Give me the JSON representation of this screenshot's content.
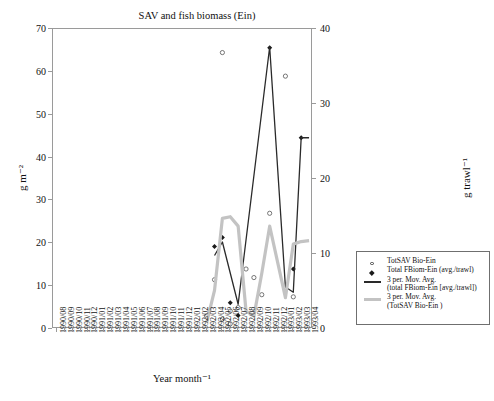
{
  "chart_data": {
    "type": "line",
    "title": "SAV and fish biomass (Ein)",
    "xlabel": "Year month⁻¹",
    "ylabel_left": "g m⁻²",
    "ylabel_right": "g trawl⁻¹",
    "ylim_left": [
      0,
      70
    ],
    "ylim_right": [
      0,
      40
    ],
    "ytick_left": [
      0,
      10,
      20,
      30,
      40,
      50,
      60,
      70
    ],
    "ytick_right": [
      0,
      10,
      20,
      30,
      40
    ],
    "grid": false,
    "legend_position": "right-outside",
    "categories": [
      "1990/08",
      "1990/09",
      "1990/10",
      "1990/11",
      "1990/12",
      "1991/01",
      "1991/02",
      "1991/03",
      "1991/04",
      "1991/05",
      "1991/06",
      "1991/07",
      "1991/08",
      "1991/09",
      "1991/10",
      "1991/11",
      "1991/12",
      "1992/01",
      "1992/02",
      "1992/03",
      "1992/04",
      "1992/05",
      "1992/06",
      "1992/07",
      "1992/08",
      "1992/09",
      "1992/10",
      "1992/11",
      "1992/12",
      "1993/01",
      "1993/02",
      "1993/03",
      "1993/04"
    ],
    "series": [
      {
        "name": "TotSAV Bio-Ein",
        "marker": "open-circle",
        "axis": "left",
        "points": [
          {
            "x": "1992/03",
            "y": 3.0
          },
          {
            "x": "1992/04",
            "y": 11.5
          },
          {
            "x": "1992/05",
            "y": 64.5
          },
          {
            "x": "1992/05",
            "y": 2.3
          },
          {
            "x": "1992/06",
            "y": 1.2
          },
          {
            "x": "1992/06",
            "y": 4.2
          },
          {
            "x": "1992/07",
            "y": 5.0
          },
          {
            "x": "1992/08",
            "y": 14.0
          },
          {
            "x": "1992/09",
            "y": 12.0
          },
          {
            "x": "1992/10",
            "y": 8.0
          },
          {
            "x": "1992/11",
            "y": 27.0
          },
          {
            "x": "1993/01",
            "y": 59.0
          },
          {
            "x": "1993/02",
            "y": 7.5
          }
        ]
      },
      {
        "name": "Total FBiom-Ein (avg./trawl)",
        "marker": "filled-diamond",
        "axis": "right",
        "points": [
          {
            "x": "1992/04",
            "y": 11.0
          },
          {
            "x": "1992/05",
            "y": 12.2
          },
          {
            "x": "1992/06",
            "y": 3.5
          },
          {
            "x": "1992/07",
            "y": 1.8
          },
          {
            "x": "1992/11",
            "y": 37.5
          },
          {
            "x": "1993/02",
            "y": 8.0
          },
          {
            "x": "1993/03",
            "y": 25.5
          }
        ]
      },
      {
        "name": "3 per. Mov. Avg.\n(total FBiom-Ein [avg./trawl])",
        "marker": "line-dark",
        "axis": "right",
        "points": [
          {
            "x": "1992/04",
            "y": 9.8
          },
          {
            "x": "1992/05",
            "y": 11.6
          },
          {
            "x": "1992/07",
            "y": 3.3
          },
          {
            "x": "1992/11",
            "y": 37.6
          },
          {
            "x": "1993/01",
            "y": 5.6
          },
          {
            "x": "1993/02",
            "y": 4.9
          },
          {
            "x": "1993/03",
            "y": 25.5
          },
          {
            "x": "1993/04",
            "y": 25.5
          }
        ]
      },
      {
        "name": "3 per. Mov. Avg.\n(TotSAV Bio-Ein )",
        "marker": "line-gray",
        "axis": "left",
        "points": [
          {
            "x": "1992/03",
            "y": 1.5
          },
          {
            "x": "1992/04",
            "y": 9.0
          },
          {
            "x": "1992/05",
            "y": 25.8
          },
          {
            "x": "1992/06",
            "y": 26.2
          },
          {
            "x": "1992/07",
            "y": 24.0
          },
          {
            "x": "1992/08",
            "y": 4.2
          },
          {
            "x": "1992/09",
            "y": 3.0
          },
          {
            "x": "1992/10",
            "y": 13.0
          },
          {
            "x": "1992/11",
            "y": 24.0
          },
          {
            "x": "1993/01",
            "y": 7.3
          },
          {
            "x": "1993/02",
            "y": 19.8
          },
          {
            "x": "1993/03",
            "y": 20.4
          },
          {
            "x": "1993/04",
            "y": 20.6
          }
        ]
      }
    ],
    "legend_entries": [
      {
        "key": "open-circle",
        "label": "TotSAV Bio-Ein"
      },
      {
        "key": "filled-diamond",
        "label": "Total FBiom-Ein (avg./trawl)"
      },
      {
        "key": "line-dark",
        "label": "3 per. Mov. Avg.\n(total FBiom-Ein [avg./trawl])"
      },
      {
        "key": "line-gray",
        "label": "3 per. Mov. Avg.\n(TotSAV Bio-Ein )"
      }
    ],
    "colors": {
      "line_dark": "#2a2a2a",
      "line_gray": "#c3c3c3",
      "marker": "#1a1a1a",
      "axis": "#9a9a9a"
    }
  }
}
